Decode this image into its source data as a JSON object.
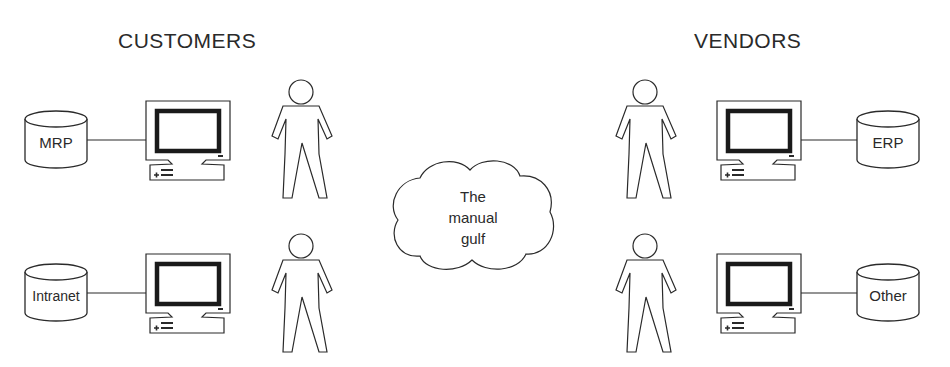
{
  "headings": {
    "left": "CUSTOMERS",
    "right": "VENDORS"
  },
  "center": {
    "cloud_lines": [
      "The",
      "manual",
      "gulf"
    ]
  },
  "customers": [
    {
      "system": "MRP"
    },
    {
      "system": "Intranet"
    }
  ],
  "vendors": [
    {
      "system": "ERP"
    },
    {
      "system": "Other"
    }
  ],
  "colors": {
    "stroke": "#2a2a2a",
    "background": "#ffffff"
  }
}
